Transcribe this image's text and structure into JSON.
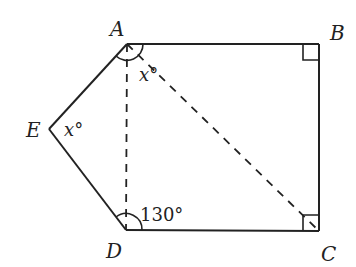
{
  "diagram": {
    "type": "geometry-figure",
    "shape": "pentagon ABCDE with dashed diagonals AD and AC",
    "vertices": {
      "A": {
        "label": "A",
        "x": 127,
        "y": 44
      },
      "B": {
        "label": "B",
        "x": 319,
        "y": 44
      },
      "C": {
        "label": "C",
        "x": 319,
        "y": 231
      },
      "D": {
        "label": "D",
        "x": 126,
        "y": 230
      },
      "E": {
        "label": "E",
        "x": 49,
        "y": 129
      }
    },
    "edges": [
      "AB",
      "BC",
      "CD",
      "DE",
      "EA"
    ],
    "dashed_segments": [
      "AD",
      "AC"
    ],
    "right_angles": [
      "B",
      "C"
    ],
    "angle_labels": {
      "A": "x°",
      "E": "x°",
      "D": "130°"
    },
    "colors": {
      "stroke": "#222222",
      "background": "#ffffff"
    }
  }
}
